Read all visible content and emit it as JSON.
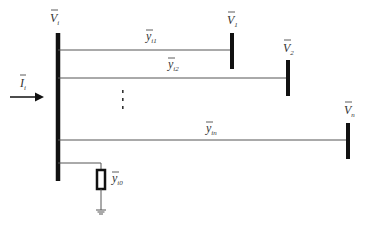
{
  "diagram": {
    "type": "power-system-node-admittance",
    "colors": {
      "bus": "#111111",
      "wire": "#555555",
      "text": "#333333",
      "background": "#ffffff"
    },
    "main_bus": {
      "label": "V",
      "sub": "i"
    },
    "injection": {
      "label": "I",
      "sub": "i"
    },
    "branches": [
      {
        "admittance_label": "y",
        "admittance_sub": "i1",
        "bus_label": "V",
        "bus_sub": "1"
      },
      {
        "admittance_label": "y",
        "admittance_sub": "i2",
        "bus_label": "V",
        "bus_sub": "2"
      },
      {
        "admittance_label": "y",
        "admittance_sub": "in",
        "bus_label": "V",
        "bus_sub": "n"
      }
    ],
    "ellipsis": "⋮",
    "shunt": {
      "admittance_label": "y",
      "admittance_sub": "i0"
    }
  }
}
